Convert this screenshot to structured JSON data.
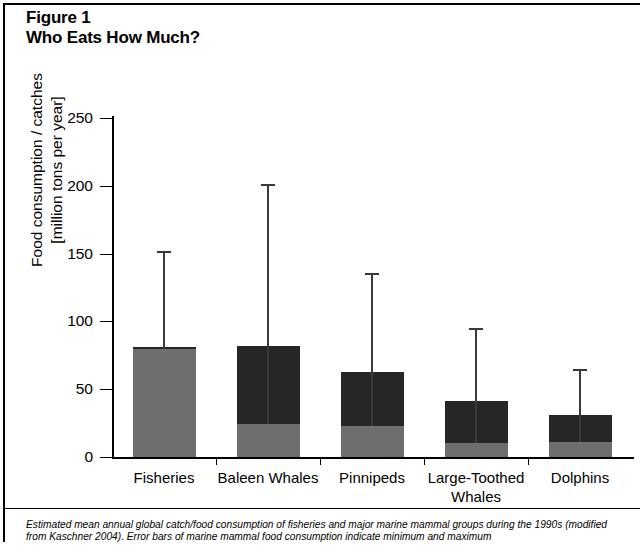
{
  "figure": {
    "title_line1": "Figure 1",
    "title_line2": "Who Eats How Much?",
    "caption_line1": "Estimated mean annual global catch/food consumption of fisheries and major marine mammal groups during the 1990s",
    "caption_line2": "(modified from Kaschner 2004). Error bars of marine mammal food consumption indicate minimum and maximum"
  },
  "colors": {
    "bar_dark": "#262626",
    "bar_gray": "#6e6e6e",
    "axis": "#000000",
    "error_bar": "#3a3a3a",
    "background": "#ffffff"
  },
  "chart_data": {
    "type": "bar",
    "title": "Who Eats How Much?",
    "xlabel": "",
    "ylabel": "Food consumption / catches [million tons per year]",
    "ylabel_line1": "Food consumption / catches",
    "ylabel_line2": "[million tons per year]",
    "ylim": [
      0,
      250
    ],
    "yticks": [
      0,
      50,
      100,
      150,
      200,
      250
    ],
    "ytick_labels": [
      "0",
      "50",
      "100",
      "150",
      "200",
      "250"
    ],
    "grid": false,
    "legend": false,
    "categories": [
      "Fisheries",
      "Baleen Whales",
      "Pinnipeds",
      "Large-Toothed Whales",
      "Dolphins"
    ],
    "category_lines": [
      [
        "Fisheries"
      ],
      [
        "Baleen Whales"
      ],
      [
        "Pinnipeds"
      ],
      [
        "Large-Toothed",
        "Whales"
      ],
      [
        "Dolphins"
      ]
    ],
    "series": [
      {
        "name": "Lower (minimum estimate) segment",
        "color": "#6e6e6e",
        "values": [
          80,
          24,
          23,
          10,
          11
        ]
      },
      {
        "name": "Upper (mean estimate) segment",
        "color": "#262626",
        "values": [
          1,
          58,
          40,
          31,
          20
        ]
      }
    ],
    "bar_totals": [
      81,
      82,
      63,
      41,
      31
    ],
    "error_bars": {
      "description": "Error bars of marine mammal food consumption indicate minimum and maximum",
      "upper": [
        152,
        201,
        136,
        95,
        65
      ],
      "lower": [
        80,
        24,
        23,
        10,
        11
      ]
    }
  }
}
